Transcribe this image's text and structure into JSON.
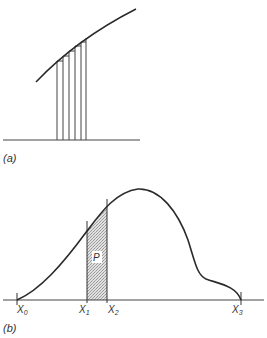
{
  "figure": {
    "panel_a": {
      "label": "(a)",
      "description": "Curve approximated by thin vertical rectangular strips"
    },
    "panel_b": {
      "label": "(b)",
      "description": "Probability density curve with shaded area P between X1 and X2",
      "region_label": "P",
      "x_labels": [
        "X",
        "X",
        "X",
        "X"
      ],
      "x_subscripts": [
        "0",
        "1",
        "2",
        "3"
      ]
    },
    "colors": {
      "line": "#2a2a2a",
      "shade": "#c8c8c8",
      "background": "#ffffff"
    }
  }
}
